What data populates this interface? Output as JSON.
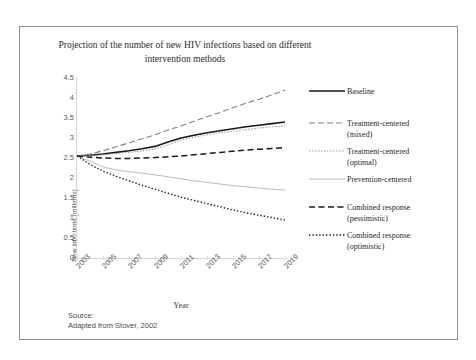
{
  "faint_header_text": "",
  "chart_title": "Projection of the number of new HIV infections based on different intervention methods",
  "axes": {
    "ylabel": "New infections (millions)",
    "xlabel": "Year",
    "yticks": [
      "4.5",
      "4",
      "3.5",
      "3",
      "2.5",
      "2",
      "1.5",
      "1",
      "0.5",
      "0"
    ],
    "xticks": [
      "2003",
      "2005",
      "2007",
      "2009",
      "2011",
      "2013",
      "2015",
      "2017",
      "2019"
    ]
  },
  "source": {
    "line1": "Source:",
    "line2": "Adapted from Stover, 2002"
  },
  "legend": {
    "items": [
      {
        "label_line1": "Baseline",
        "label_line2": "",
        "style": "solid-black-thick",
        "color": "#1a1a1a"
      },
      {
        "label_line1": "Treatment-centered",
        "label_line2": "(mixed)",
        "style": "longdash-gray",
        "color": "#808080"
      },
      {
        "label_line1": "Treatment-centered",
        "label_line2": "(optimal)",
        "style": "dotted-gray",
        "color": "#9a9a9a"
      },
      {
        "label_line1": "Prevention-centered",
        "label_line2": "",
        "style": "solid-lightgray-thin",
        "color": "#b3b3b3"
      },
      {
        "label_line1": "Combined response",
        "label_line2": "(pessimistic)",
        "style": "longdash-black",
        "color": "#1a1a1a"
      },
      {
        "label_line1": "Combined response",
        "label_line2": "(optimistic)",
        "style": "dotted-black",
        "color": "#1a1a1a"
      }
    ]
  },
  "chart_data": {
    "type": "line",
    "title": "Projection of the number of new HIV infections based on different intervention methods",
    "xlabel": "Year",
    "ylabel": "New infections (millions)",
    "xlim": [
      2003,
      2019
    ],
    "ylim": [
      0,
      4.5
    ],
    "ytick_step": 0.5,
    "grid": false,
    "legend_position": "right",
    "source_note": "Adapted from Stover, 2002",
    "x": [
      2003,
      2004,
      2005,
      2006,
      2007,
      2008,
      2009,
      2010,
      2011,
      2012,
      2013,
      2014,
      2015,
      2016,
      2017,
      2018,
      2019
    ],
    "series": [
      {
        "name": "Baseline",
        "style": "solid-black-thick",
        "color": "#1a1a1a",
        "values": [
          2.55,
          2.57,
          2.6,
          2.64,
          2.68,
          2.73,
          2.79,
          2.9,
          3.0,
          3.07,
          3.13,
          3.18,
          3.23,
          3.28,
          3.32,
          3.36,
          3.4
        ]
      },
      {
        "name": "Treatment-centered (mixed)",
        "style": "longdash-gray",
        "color": "#808080",
        "values": [
          2.55,
          2.6,
          2.68,
          2.78,
          2.88,
          2.98,
          3.08,
          3.2,
          3.3,
          3.42,
          3.53,
          3.64,
          3.76,
          3.87,
          3.97,
          4.08,
          4.2
        ]
      },
      {
        "name": "Treatment-centered (optimal)",
        "style": "dotted-gray",
        "color": "#9a9a9a",
        "values": [
          2.55,
          2.56,
          2.58,
          2.61,
          2.64,
          2.68,
          2.72,
          2.83,
          2.95,
          3.02,
          3.08,
          3.13,
          3.17,
          3.21,
          3.25,
          3.28,
          3.3
        ]
      },
      {
        "name": "Prevention-centered",
        "style": "solid-lightgray-thin",
        "color": "#b3b3b3",
        "values": [
          2.55,
          2.42,
          2.28,
          2.2,
          2.16,
          2.12,
          2.08,
          2.03,
          1.98,
          1.93,
          1.89,
          1.85,
          1.81,
          1.78,
          1.75,
          1.72,
          1.7
        ]
      },
      {
        "name": "Combined response (pessimistic)",
        "style": "longdash-black",
        "color": "#1a1a1a",
        "values": [
          2.55,
          2.52,
          2.5,
          2.49,
          2.49,
          2.5,
          2.51,
          2.53,
          2.55,
          2.58,
          2.61,
          2.64,
          2.67,
          2.7,
          2.72,
          2.74,
          2.76
        ]
      },
      {
        "name": "Combined response (optimistic)",
        "style": "dotted-black",
        "color": "#1a1a1a",
        "values": [
          2.55,
          2.34,
          2.17,
          2.04,
          1.93,
          1.82,
          1.72,
          1.62,
          1.52,
          1.44,
          1.36,
          1.28,
          1.2,
          1.13,
          1.07,
          1.01,
          0.95
        ]
      }
    ]
  }
}
